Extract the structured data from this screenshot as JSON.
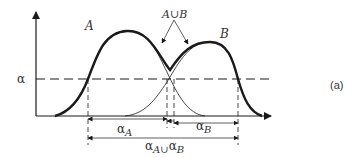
{
  "figure": {
    "panel_label": "(a)",
    "y_level_label": "α",
    "curve_a_label": "A",
    "curve_b_label": "B",
    "union_label": "A∪B",
    "dim_a_label": "α",
    "dim_a_sub": "A",
    "dim_b_label": "α",
    "dim_b_sub": "B",
    "dim_union_label": "α",
    "dim_union_sub": "A∪",
    "dim_union_label2": "α",
    "dim_union_sub2": "B"
  },
  "colors": {
    "stroke": "#1a1a1a",
    "text": "#333333"
  }
}
